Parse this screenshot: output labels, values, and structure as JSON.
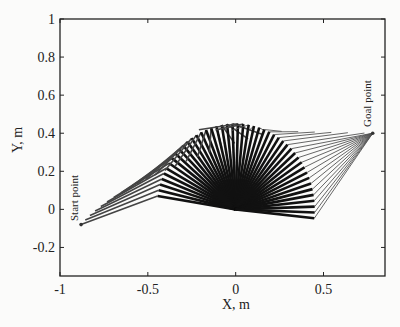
{
  "chart_data": {
    "type": "line",
    "title": "",
    "xlabel": "X, m",
    "ylabel": "Y, m",
    "xlim": [
      -1,
      0.85
    ],
    "ylim": [
      -0.35,
      1
    ],
    "xticks": [
      -1,
      -0.5,
      0,
      0.5
    ],
    "xtick_labels": [
      "-1",
      "-0.5",
      "0",
      "0.5"
    ],
    "yticks": [
      -0.2,
      0,
      0.2,
      0.4,
      0.6,
      0.8,
      1
    ],
    "ytick_labels": [
      "-0.2",
      "0",
      "0.2",
      "0.4",
      "0.6",
      "0.8",
      "1"
    ],
    "grid": false,
    "legend": null,
    "annotations": [
      {
        "text": "Start point",
        "x": -0.88,
        "y": -0.08
      },
      {
        "text": "Goal point",
        "x": 0.78,
        "y": 0.4
      }
    ],
    "base": [
      0,
      0
    ],
    "start_point": [
      -0.88,
      -0.08
    ],
    "goal_point": [
      0.78,
      0.4
    ],
    "link1_length": 0.45,
    "elbow_angle_start_deg": 171,
    "elbow_angle_end_deg": -6,
    "num_frames": 46,
    "series": [
      {
        "name": "link 1",
        "color": "#111111"
      },
      {
        "name": "link 2",
        "color": "#555555"
      }
    ]
  }
}
